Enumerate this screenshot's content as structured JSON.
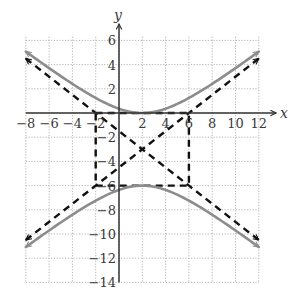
{
  "chart_data": {
    "type": "line",
    "title": "",
    "xlabel": "x",
    "ylabel": "y",
    "xlim": [
      -8,
      12
    ],
    "ylim": [
      -14,
      6
    ],
    "grid": true,
    "grid_step": 2,
    "x_ticks": [
      -8,
      -6,
      -4,
      -2,
      2,
      4,
      6,
      8,
      10,
      12
    ],
    "x_tick_labels": [
      "−8",
      "−6",
      "−4",
      "−2",
      "2",
      "4",
      "6",
      "8",
      "10",
      "12"
    ],
    "y_ticks": [
      6,
      4,
      2,
      -2,
      -4,
      -6,
      -8,
      -10,
      -12,
      -14
    ],
    "y_tick_labels": [
      "6",
      "4",
      "2",
      "−2",
      "−4",
      "−6",
      "−8",
      "−10",
      "−12",
      "−14"
    ],
    "hyperbola": {
      "equation": "(y+3)^2/9 - (x-2)^2/16 = 1",
      "center": [
        2,
        -3
      ],
      "a": 3,
      "b": 4,
      "vertices": [
        [
          2,
          0
        ],
        [
          2,
          -6
        ]
      ],
      "x_range": [
        -8,
        12
      ],
      "color": "#8c8c8c"
    },
    "asymptotes": [
      {
        "name": "rising",
        "points": [
          [
            -8,
            -10.5
          ],
          [
            12,
            4.5
          ]
        ],
        "slope": 0.75
      },
      {
        "name": "falling",
        "points": [
          [
            -8,
            4.5
          ],
          [
            12,
            -10.5
          ]
        ],
        "slope": -0.75
      }
    ],
    "fundamental_rectangle": {
      "corners": [
        [
          -2,
          0
        ],
        [
          6,
          0
        ],
        [
          6,
          -6
        ],
        [
          -2,
          -6
        ]
      ]
    },
    "series": [
      {
        "name": "upper branch",
        "style": "solid gray",
        "x": [
          -8,
          -6,
          -4,
          -2,
          0,
          2,
          4,
          6,
          8,
          10,
          12
        ],
        "y": [
          5.08,
          2.0,
          -0.5,
          -0.63,
          0.35,
          0.0,
          0.35,
          1.24,
          2.41,
          3.75,
          5.08
        ]
      },
      {
        "name": "lower branch",
        "style": "solid gray",
        "x": [
          -8,
          -6,
          -4,
          -2,
          0,
          2,
          4,
          6,
          8,
          10,
          12
        ],
        "y": [
          -11.08,
          -9.0,
          -8.41,
          -7.24,
          -6.35,
          -6.0,
          -6.35,
          -7.24,
          -8.41,
          -9.75,
          -11.08
        ]
      },
      {
        "name": "asymptote y = 3/4(x-2) - 3",
        "style": "dashed black",
        "x": [
          -8,
          12
        ],
        "y": [
          -10.5,
          4.5
        ]
      },
      {
        "name": "asymptote y = -3/4(x-2) - 3",
        "style": "dashed black",
        "x": [
          -8,
          12
        ],
        "y": [
          4.5,
          -10.5
        ]
      }
    ]
  }
}
